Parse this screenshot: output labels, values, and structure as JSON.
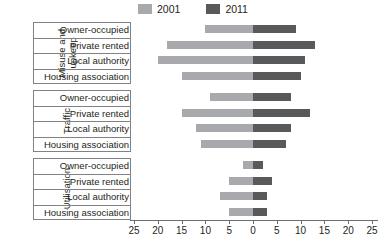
{
  "legend": {
    "items": [
      {
        "label": "2001",
        "color": "#a7a9ac",
        "name": "legend-2001"
      },
      {
        "label": "2011",
        "color": "#58595b",
        "name": "legend-2011"
      }
    ]
  },
  "axis": {
    "ticks": [
      "25",
      "20",
      "15",
      "10",
      "5",
      "0",
      "5",
      "10",
      "15",
      "20",
      "25"
    ]
  },
  "groups": [
    {
      "name": "Misuse and\nupkeep",
      "rows": [
        "Owner-occupied",
        "Private rented",
        "Local authority",
        "Housing association"
      ]
    },
    {
      "name": "Traffic",
      "rows": [
        "Owner-occupied",
        "Private rented",
        "Local authority",
        "Housing association"
      ]
    },
    {
      "name": "Utilisation",
      "rows": [
        "Owner-occupied",
        "Private rented",
        "Local authority",
        "Housing association"
      ]
    }
  ],
  "chart_data": {
    "type": "bar",
    "orientation": "horizontal-diverging",
    "title": "",
    "xlabel": "",
    "ylabel": "",
    "xlim": [
      -25,
      25
    ],
    "xtick_labels": [
      "25",
      "20",
      "15",
      "10",
      "5",
      "0",
      "5",
      "10",
      "15",
      "20",
      "25"
    ],
    "xtick_values": [
      -25,
      -20,
      -15,
      -10,
      -5,
      0,
      5,
      10,
      15,
      20,
      25
    ],
    "grid": false,
    "legend_position": "top-center",
    "note": "Left side of zero is the 2001 series, right side of zero is the 2011 series; values are magnitudes in percent.",
    "series": [
      {
        "name": "2001",
        "color": "#a7a9ac",
        "side": "left"
      },
      {
        "name": "2011",
        "color": "#58595b",
        "side": "right"
      }
    ],
    "groups": [
      {
        "group": "Misuse and upkeep",
        "categories": [
          "Owner-occupied",
          "Private rented",
          "Local authority",
          "Housing association"
        ],
        "values_2001": [
          10,
          18,
          20,
          15
        ],
        "values_2011": [
          9,
          13,
          11,
          10
        ]
      },
      {
        "group": "Traffic",
        "categories": [
          "Owner-occupied",
          "Private rented",
          "Local authority",
          "Housing association"
        ],
        "values_2001": [
          9,
          15,
          12,
          11
        ],
        "values_2011": [
          8,
          12,
          8,
          7
        ]
      },
      {
        "group": "Utilisation",
        "categories": [
          "Owner-occupied",
          "Private rented",
          "Local authority",
          "Housing association"
        ],
        "values_2001": [
          2,
          5,
          7,
          5
        ],
        "values_2011": [
          2,
          4,
          3,
          3
        ]
      }
    ]
  }
}
